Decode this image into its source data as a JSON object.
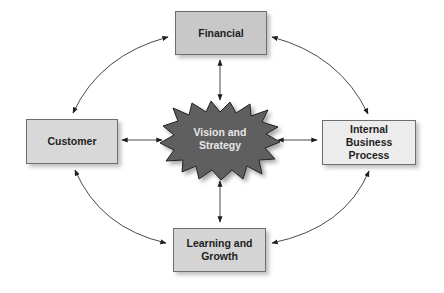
{
  "diagram": {
    "center": {
      "label": "Vision and\nStrategy",
      "fill": "#5f5f5f",
      "text_color": "#e6e6e6"
    },
    "nodes": [
      {
        "id": "financial",
        "label": "Financial",
        "fill": "#c8c8c8"
      },
      {
        "id": "customer",
        "label": "Customer",
        "fill": "#d8d8d8"
      },
      {
        "id": "internal",
        "label": "Internal\nBusiness\nProcess",
        "fill": "#ececec"
      },
      {
        "id": "learning",
        "label": "Learning and\nGrowth",
        "fill": "#d4d4d4"
      }
    ],
    "edges": [
      "financial<->center",
      "customer<->center",
      "internal<->center",
      "learning<->center",
      "financial<->customer",
      "financial<->internal",
      "customer<->learning",
      "internal<->learning"
    ]
  }
}
